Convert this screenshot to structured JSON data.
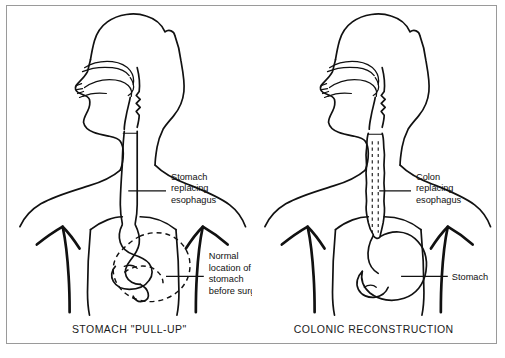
{
  "figure": {
    "type": "medical-illustration",
    "border_color": "#9a9a9a",
    "ink_color": "#111111",
    "background": "#ffffff",
    "panels": [
      {
        "id": "stomach-pull-up",
        "caption": "STOMACH \"PULL-UP\"",
        "annotations": [
          {
            "id": "stomach-replacing-esophagus",
            "lines": [
              "Stomach",
              "replacing",
              "esophagus"
            ]
          },
          {
            "id": "normal-location-of-stomach",
            "lines": [
              "Normal",
              "location of",
              "stomach",
              "before surgery"
            ]
          }
        ],
        "structures": [
          "head-and-neck-profile",
          "oral-cavity",
          "tongue",
          "pharynx",
          "gastric-conduit",
          "rib-cage",
          "stomach-pulled-up",
          "dashed-original-stomach-outline"
        ]
      },
      {
        "id": "colonic-reconstruction",
        "caption": "COLONIC RECONSTRUCTION",
        "annotations": [
          {
            "id": "colon-replacing-esophagus",
            "lines": [
              "Colon",
              "replacing",
              "esophagus"
            ]
          },
          {
            "id": "stomach",
            "lines": [
              "Stomach"
            ]
          }
        ],
        "structures": [
          "head-and-neck-profile",
          "oral-cavity",
          "tongue",
          "pharynx",
          "colonic-interposition-graft",
          "rib-cage",
          "stomach-in-situ"
        ]
      }
    ]
  },
  "page_footer": {
    "text": ""
  }
}
